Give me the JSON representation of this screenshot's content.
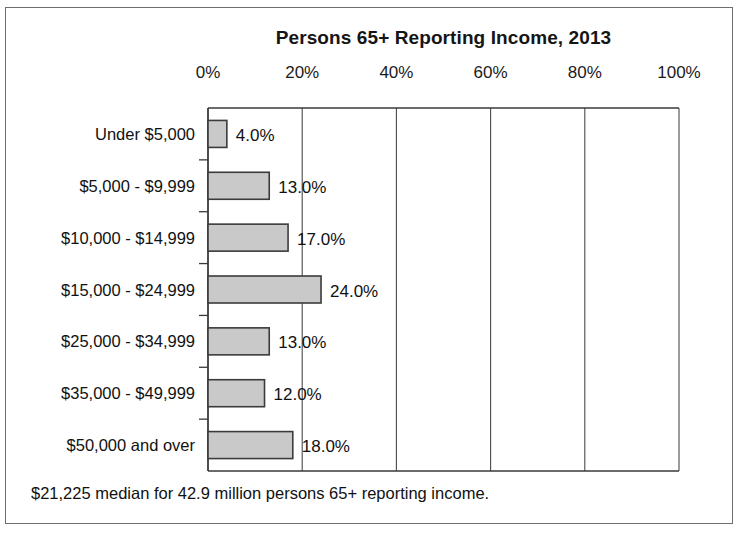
{
  "figure": {
    "title": "Persons 65+ Reporting Income, 2013",
    "footnote": "$21,225 median for 42.9 million persons 65+ reporting income.",
    "frame_color": "#6e6e6e",
    "bar_fill": "#c9c9c9",
    "bar_stroke": "#3b3b3b",
    "axis_color": "#3a3a3a",
    "grid_color": "#4a4a4a",
    "text_color": "#111111"
  },
  "chart_data": {
    "type": "bar",
    "orientation": "horizontal",
    "title": "Persons 65+ Reporting Income, 2013",
    "categories": [
      "Under $5,000",
      "$5,000 - $9,999",
      "$10,000 - $14,999",
      "$15,000 - $24,999",
      "$25,000 - $34,999",
      "$35,000 - $49,999",
      "$50,000 and over"
    ],
    "values": [
      4.0,
      13.0,
      17.0,
      24.0,
      13.0,
      12.0,
      18.0
    ],
    "value_labels": [
      "4.0%",
      "13.0%",
      "17.0%",
      "24.0%",
      "13.0%",
      "12.0%",
      "18.0%"
    ],
    "xlabel": "",
    "ylabel": "",
    "xlim": [
      0,
      100
    ],
    "xticks": [
      0,
      20,
      40,
      60,
      80,
      100
    ],
    "xtick_labels": [
      "0%",
      "20%",
      "40%",
      "60%",
      "80%",
      "100%"
    ],
    "grid": true,
    "legend": false,
    "annotation": "$21,225 median for 42.9 million persons 65+ reporting income."
  }
}
